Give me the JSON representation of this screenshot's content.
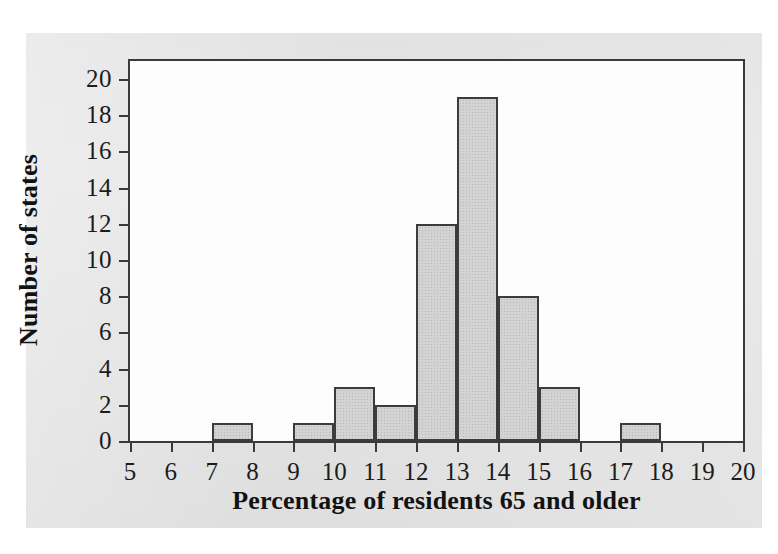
{
  "figure": {
    "background_color": "#ffffff",
    "panel_color": "#e6e6e6",
    "plot_background_color": "#fdfdfd",
    "bar_fill_color": "#d3d3d3",
    "bar_edge_color": "#3c3c3c",
    "axis_color": "#3a3a3a",
    "text_color": "#1c1c1c"
  },
  "chart_data": {
    "type": "bar",
    "title": "",
    "xlabel": "Percentage of residents 65 and older",
    "ylabel": "Number of states",
    "xlim": [
      5,
      20
    ],
    "ylim": [
      0,
      21
    ],
    "grid": false,
    "legend": false,
    "bin_width": 1,
    "bin_edges": [
      5,
      6,
      7,
      8,
      9,
      10,
      11,
      12,
      13,
      14,
      15,
      16,
      17,
      18,
      19,
      20
    ],
    "categories": [
      "5-6",
      "6-7",
      "7-8",
      "8-9",
      "9-10",
      "10-11",
      "11-12",
      "12-13",
      "13-14",
      "14-15",
      "15-16",
      "16-17",
      "17-18",
      "18-19",
      "19-20"
    ],
    "values": [
      0,
      0,
      1,
      0,
      1,
      3,
      2,
      12,
      19,
      8,
      3,
      0,
      1,
      0,
      0
    ],
    "total": 50,
    "xticks": [
      "5",
      "6",
      "7",
      "8",
      "9",
      "10",
      "11",
      "12",
      "13",
      "14",
      "15",
      "16",
      "17",
      "18",
      "19",
      "20"
    ],
    "xtick_values": [
      5,
      6,
      7,
      8,
      9,
      10,
      11,
      12,
      13,
      14,
      15,
      16,
      17,
      18,
      19,
      20
    ],
    "yticks": [
      "0",
      "2",
      "4",
      "6",
      "8",
      "10",
      "12",
      "14",
      "16",
      "18",
      "20"
    ],
    "ytick_values": [
      0,
      2,
      4,
      6,
      8,
      10,
      12,
      14,
      16,
      18,
      20
    ]
  }
}
